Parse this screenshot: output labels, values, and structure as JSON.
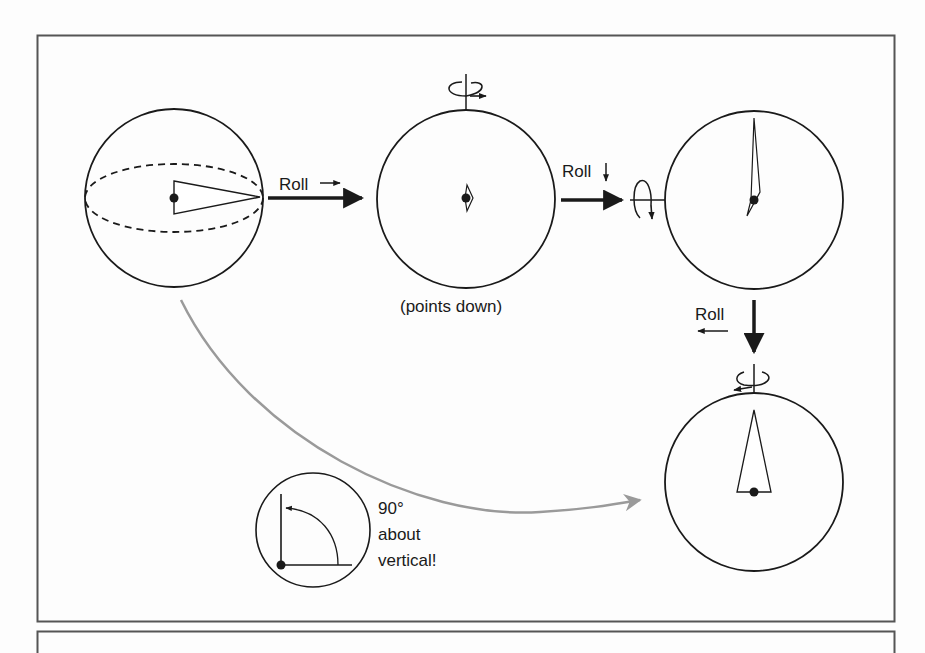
{
  "diagram": {
    "title": "",
    "steps": [
      {
        "id": "sphere-1",
        "description": "Sphere with dashed equator; pointer triangle points right"
      },
      {
        "id": "sphere-2",
        "description": "Pointer points down (toward viewer)",
        "caption": "(points down)"
      },
      {
        "id": "sphere-3",
        "description": "Pointer points up"
      },
      {
        "id": "sphere-4",
        "description": "Pointer points up, base at center"
      }
    ],
    "transitions": [
      {
        "from": "sphere-1",
        "to": "sphere-2",
        "label": "Roll",
        "direction_glyph": "→"
      },
      {
        "from": "sphere-2",
        "to": "sphere-3",
        "label": "Roll",
        "direction_glyph": "↓"
      },
      {
        "from": "sphere-3",
        "to": "sphere-4",
        "label": "Roll",
        "direction_glyph": "←"
      }
    ],
    "net_effect": {
      "from": "sphere-1",
      "to": "sphere-4",
      "angle": "90°",
      "line1": "90°",
      "line2": "about",
      "line3": "vertical!"
    },
    "colors": {
      "stroke": "#1a1a1a",
      "frame": "#555555",
      "net_arrow": "#9a9a9a",
      "background": "#fdfdfd"
    }
  }
}
